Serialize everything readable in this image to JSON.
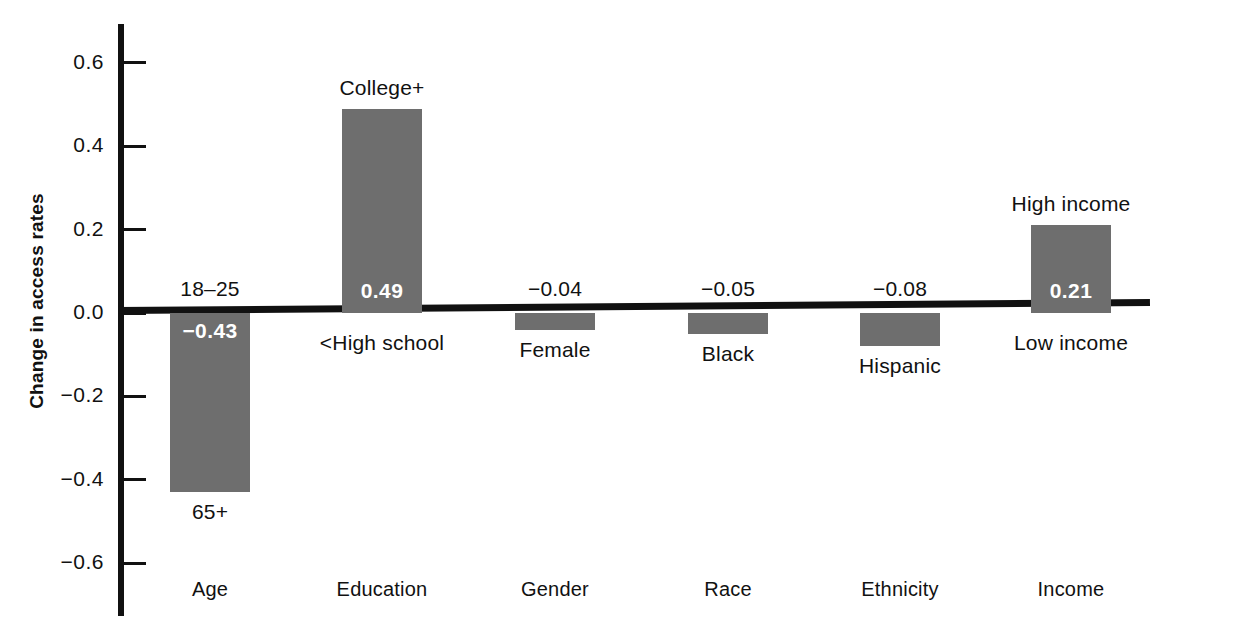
{
  "chart_data": {
    "type": "bar",
    "title": "",
    "subtitle": "",
    "xlabel": "",
    "ylabel": "Change in access rates",
    "ylim": [
      -0.7,
      0.68
    ],
    "grid": false,
    "legend": null,
    "orientation": "vertical",
    "bar_color": "#6e6e6e",
    "axis_color": "#111111",
    "yticks": [
      "0.6",
      "0.4",
      "0.2",
      "0.0",
      "−0.2",
      "−0.4",
      "−0.6"
    ],
    "ytick_values": [
      0.6,
      0.4,
      0.2,
      0.0,
      -0.2,
      -0.4,
      -0.6
    ],
    "categories": [
      "Age",
      "Education",
      "Gender",
      "Race",
      "Ethnicity",
      "Income"
    ],
    "values": [
      -0.43,
      0.49,
      -0.04,
      -0.05,
      -0.08,
      0.21
    ],
    "bars": [
      {
        "group": "Age",
        "value": -0.43,
        "value_label": "−0.43",
        "value_label_inside": true,
        "top_label": "18–25",
        "bottom_label": "65+"
      },
      {
        "group": "Education",
        "value": 0.49,
        "value_label": "0.49",
        "value_label_inside": true,
        "top_label": "College+",
        "bottom_label": "<High school"
      },
      {
        "group": "Gender",
        "value": -0.04,
        "value_label": "−0.04",
        "value_label_inside": false,
        "top_label": "",
        "bottom_label": "Female"
      },
      {
        "group": "Race",
        "value": -0.05,
        "value_label": "−0.05",
        "value_label_inside": false,
        "top_label": "",
        "bottom_label": "Black"
      },
      {
        "group": "Ethnicity",
        "value": -0.08,
        "value_label": "−0.08",
        "value_label_inside": false,
        "top_label": "",
        "bottom_label": "Hispanic"
      },
      {
        "group": "Income",
        "value": 0.21,
        "value_label": "0.21",
        "value_label_inside": true,
        "top_label": "High income",
        "bottom_label": "Low income"
      }
    ]
  }
}
